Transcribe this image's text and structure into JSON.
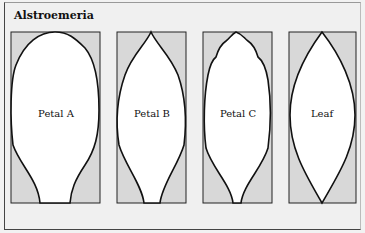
{
  "title": "Alstroemeria",
  "colors": {
    "box_fill": "#d8d8d8",
    "shape_fill": "#ffffff",
    "stroke": "#111111",
    "background": "#f0f0f0"
  },
  "panels": [
    {
      "id": "petal-a",
      "label": "Petal A"
    },
    {
      "id": "petal-b",
      "label": "Petal B"
    },
    {
      "id": "petal-c",
      "label": "Petal C"
    },
    {
      "id": "leaf",
      "label": "Leaf"
    }
  ]
}
